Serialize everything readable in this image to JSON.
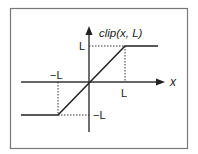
{
  "diagram": {
    "title": "clip(x, L)",
    "x_axis_label": "x",
    "y_axis_label": "clip(x, L)",
    "tick_labels": {
      "x_positive": "L",
      "x_negative": "−L",
      "y_positive": "L",
      "y_negative": "−L"
    },
    "colors": {
      "line": "#333333",
      "border": "#777777",
      "background": "#ffffff"
    }
  }
}
